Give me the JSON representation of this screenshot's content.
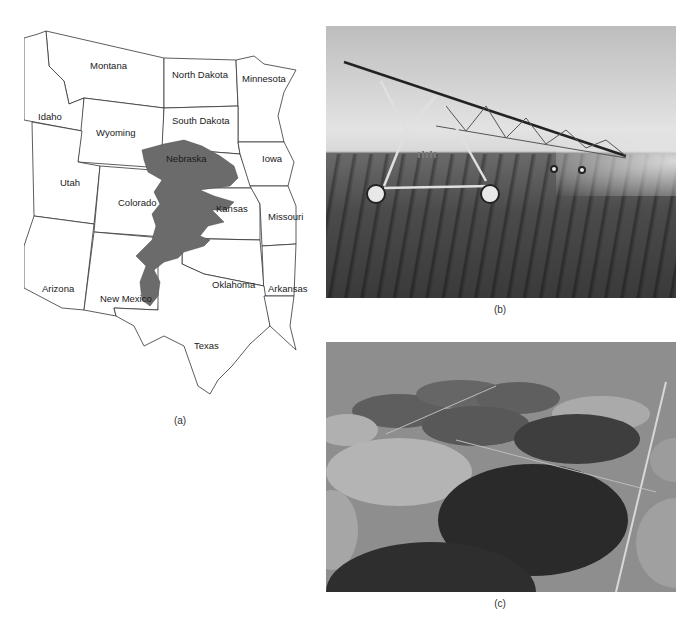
{
  "header": {
    "running_text": "Groundwater depletion and irrigation",
    "page_number": ""
  },
  "figure": {
    "panel_a": {
      "caption": "(a)",
      "type": "map",
      "highlight_color": "#6b6b6b",
      "states": [
        {
          "name": "Montana"
        },
        {
          "name": "North Dakota"
        },
        {
          "name": "Minnesota"
        },
        {
          "name": "Idaho"
        },
        {
          "name": "Wyoming"
        },
        {
          "name": "South Dakota"
        },
        {
          "name": "Nebraska"
        },
        {
          "name": "Iowa"
        },
        {
          "name": "Utah"
        },
        {
          "name": "Colorado"
        },
        {
          "name": "Kansas"
        },
        {
          "name": "Missouri"
        },
        {
          "name": "Arizona"
        },
        {
          "name": "New Mexico"
        },
        {
          "name": "Oklahoma"
        },
        {
          "name": "Arkansas"
        },
        {
          "name": "Texas"
        }
      ]
    },
    "panel_b": {
      "caption": "(b)",
      "description": "Center-pivot irrigation sprinkler over crop rows"
    },
    "panel_c": {
      "caption": "(c)",
      "description": "Aerial view of circular center-pivot irrigated fields"
    }
  }
}
